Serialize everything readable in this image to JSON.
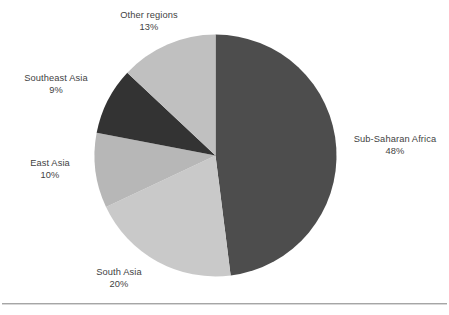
{
  "chart_data": {
    "type": "pie",
    "title": "",
    "subtitle": "",
    "legend_position": "labels-outside",
    "grid": false,
    "start_angle_deg": 0,
    "direction": "clockwise",
    "categories": [
      "Sub-Saharan Africa",
      "South Asia",
      "East Asia",
      "Southeast Asia",
      "Other regions"
    ],
    "values": [
      48,
      20,
      10,
      9,
      13
    ],
    "value_unit": "%",
    "colors": [
      "#4d4d4d",
      "#c9c9c9",
      "#b7b7b7",
      "#333333",
      "#c0c0c0"
    ],
    "slices": [
      {
        "name": "Sub-Saharan Africa",
        "value": 48,
        "label_text": "Sub-Saharan Africa",
        "percent_text": "48%",
        "color": "#4d4d4d"
      },
      {
        "name": "South Asia",
        "value": 20,
        "label_text": "South Asia",
        "percent_text": "20%",
        "color": "#c9c9c9"
      },
      {
        "name": "East Asia",
        "value": 10,
        "label_text": "East Asia",
        "percent_text": "10%",
        "color": "#b7b7b7"
      },
      {
        "name": "Southeast Asia",
        "value": 9,
        "label_text": "Southeast Asia",
        "percent_text": "9%",
        "color": "#333333"
      },
      {
        "name": "Other regions",
        "value": 13,
        "label_text": "Other regions",
        "percent_text": "13%",
        "color": "#c0c0c0"
      }
    ],
    "xlabel": "",
    "ylabel": ""
  },
  "labels": {
    "sub_saharan_africa": {
      "name": "Sub-Saharan Africa",
      "percent": "48%"
    },
    "south_asia": {
      "name": "South Asia",
      "percent": "20%"
    },
    "east_asia": {
      "name": "East Asia",
      "percent": "10%"
    },
    "southeast_asia": {
      "name": "Southeast Asia",
      "percent": "9%"
    },
    "other_regions": {
      "name": "Other regions",
      "percent": "13%"
    }
  },
  "style": {
    "background": "#ffffff",
    "label_color": "#3f3f3f",
    "rule_color": "#a6a6a6"
  }
}
